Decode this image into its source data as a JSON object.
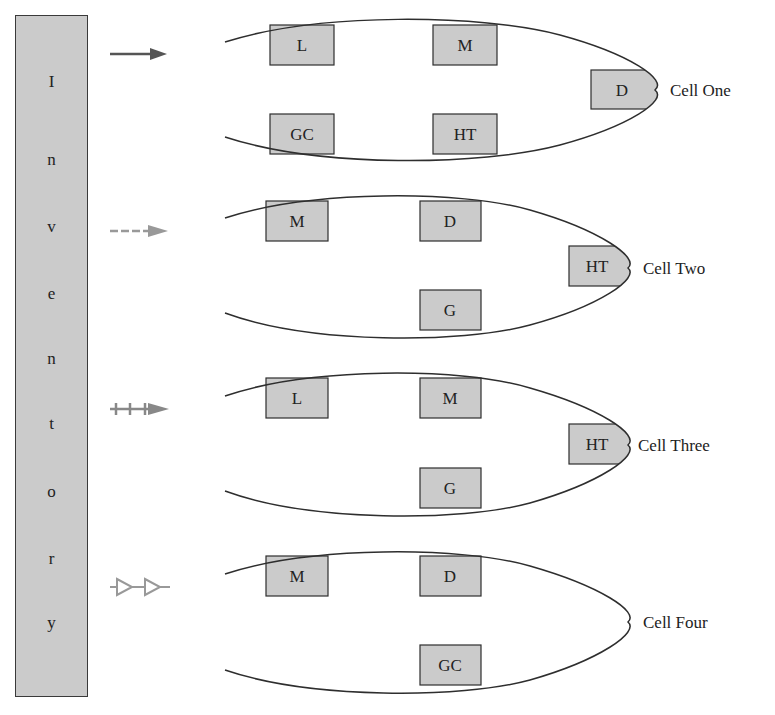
{
  "figure": {
    "inventory": {
      "label": "Inventory",
      "letters": [
        "I",
        "n",
        "v",
        "e",
        "n",
        "t",
        "o",
        "r",
        "y"
      ]
    },
    "colors": {
      "machine_fill": "#cbcbcb",
      "outline": "#2e2e2e",
      "arrow_gray": "#8a8a8a",
      "arrow_dark": "#555555"
    },
    "flows": [
      {
        "style": "solid",
        "target": "Cell One"
      },
      {
        "style": "dashed",
        "target": "Cell Two"
      },
      {
        "style": "plus-marked",
        "target": "Cell Three"
      },
      {
        "style": "triangle-chain",
        "target": "Cell Four"
      }
    ],
    "cells": [
      {
        "name": "Cell One",
        "machines": [
          "L",
          "M",
          "D",
          "GC",
          "HT"
        ]
      },
      {
        "name": "Cell Two",
        "machines": [
          "M",
          "D",
          "HT",
          "G"
        ]
      },
      {
        "name": "Cell Three",
        "machines": [
          "L",
          "M",
          "HT",
          "G"
        ]
      },
      {
        "name": "Cell Four",
        "machines": [
          "M",
          "D",
          "GC"
        ]
      }
    ]
  }
}
